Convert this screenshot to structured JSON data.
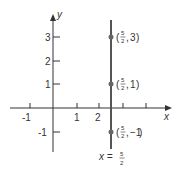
{
  "diagram": {
    "axes": {
      "x_label": "x",
      "y_label": "y",
      "x_ticks": [
        "-1",
        "1",
        "2"
      ],
      "y_ticks": [
        "3",
        "2",
        "1",
        "-1"
      ]
    },
    "line": {
      "equation_lhs": "x =",
      "equation_num": "5",
      "equation_den": "2",
      "color": "#555555"
    },
    "points": [
      {
        "x_num": "5",
        "x_den": "2",
        "y": "3",
        "paren_open": "(",
        "sep": ",",
        "paren_close": ")"
      },
      {
        "x_num": "5",
        "x_den": "2",
        "y": "1",
        "paren_open": "(",
        "sep": ",",
        "paren_close": ")"
      },
      {
        "x_num": "5",
        "x_den": "2",
        "y": "−1",
        "paren_open": "(",
        "sep": ",",
        "paren_close": ")"
      }
    ],
    "colors": {
      "axis": "#333333",
      "point": "#666666"
    }
  }
}
